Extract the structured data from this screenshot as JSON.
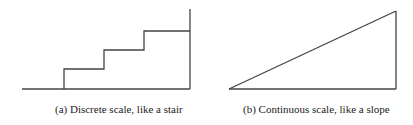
{
  "figures": [
    {
      "id": "a",
      "caption": "(a) Discrete scale, like a stair",
      "shape": "stair",
      "stroke_color": "#444444",
      "points": [
        [
          22,
          89
        ],
        [
          64,
          89
        ],
        [
          64,
          69
        ],
        [
          104,
          69
        ],
        [
          104,
          50
        ],
        [
          144,
          50
        ],
        [
          144,
          31
        ],
        [
          190,
          31
        ],
        [
          190,
          9
        ]
      ],
      "baseline": [
        [
          22,
          89
        ],
        [
          190,
          89
        ]
      ]
    },
    {
      "id": "b",
      "caption": "(b) Continuous scale, like a slope",
      "shape": "slope",
      "stroke_color": "#444444",
      "points": [
        [
          229,
          89
        ],
        [
          396,
          11
        ],
        [
          396,
          89
        ]
      ]
    }
  ]
}
